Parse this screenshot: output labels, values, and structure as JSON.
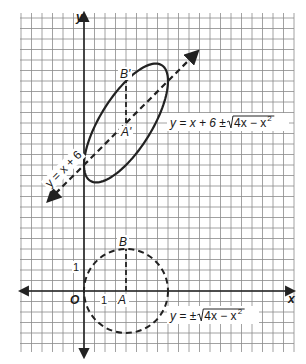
{
  "figure": {
    "type": "coordinate-plane",
    "canvas": {
      "width": 306,
      "height": 364
    },
    "origin_px": [
      84,
      291
    ],
    "unit_px": 21,
    "grid": {
      "x_min_px": 20,
      "x_max_px": 294,
      "y_min_px": 13,
      "y_max_px": 352,
      "spacing_px": 10.5,
      "color": "#8a8a8a"
    },
    "axes": {
      "x_label": "x",
      "y_label": "y",
      "origin_label": "O",
      "tick_x_label": "1",
      "tick_y_label": "1",
      "color": "#222222"
    },
    "colors": {
      "curve": "#222222",
      "text": "#1a1a1a",
      "background": "#ffffff"
    }
  },
  "circle": {
    "equation_label": {
      "prefix": "y = ± ",
      "radicand": "4x − x",
      "exp": "2"
    },
    "center": [
      2,
      0
    ],
    "radius": 2,
    "style": "dashed",
    "points": {
      "A": {
        "label": "A",
        "coords": [
          2,
          0
        ]
      },
      "B": {
        "label": "B",
        "coords": [
          2,
          2
        ]
      }
    }
  },
  "ellipse": {
    "equation_label": {
      "prefix": "y = x + 6 ± ",
      "radicand": "4x − x",
      "exp": "2"
    },
    "style": "solid",
    "points": {
      "A_prime": {
        "label": "A'",
        "coords": [
          2,
          8
        ]
      },
      "B_prime": {
        "label": "B'",
        "coords": [
          2,
          10
        ]
      }
    }
  },
  "line": {
    "equation_label": "y = x + 6",
    "slope": 1,
    "intercept": 6,
    "style": "dashed",
    "x_from": -1.7,
    "x_to": 5.4
  }
}
